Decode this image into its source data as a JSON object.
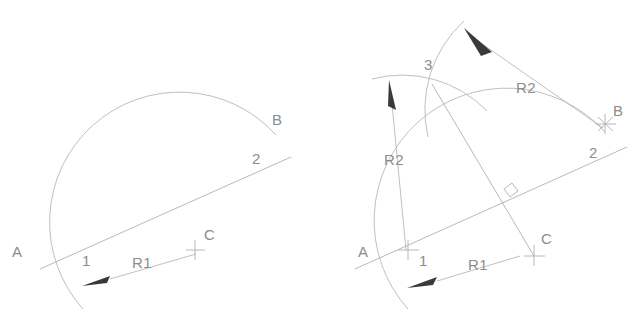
{
  "drawing": {
    "title": "Arc through three points construction",
    "background_color": "#ffffff",
    "line_color": "#b0b0b0",
    "arc_color": "#b8b8b8",
    "text_color": "#8c8c8c",
    "arrow_color": "#3a3a3a",
    "panels": [
      {
        "name": "step-1",
        "labels": [
          {
            "key": "point_a",
            "text": "A"
          },
          {
            "key": "point_b",
            "text": "B"
          },
          {
            "key": "point_c",
            "text": "C"
          },
          {
            "key": "point_1",
            "text": "1"
          },
          {
            "key": "point_2",
            "text": "2"
          },
          {
            "key": "radius_1",
            "text": "R1"
          }
        ]
      },
      {
        "name": "step-2",
        "labels": [
          {
            "key": "point_a",
            "text": "A"
          },
          {
            "key": "point_b",
            "text": "B"
          },
          {
            "key": "point_c",
            "text": "C"
          },
          {
            "key": "point_1",
            "text": "1"
          },
          {
            "key": "point_2",
            "text": "2"
          },
          {
            "key": "point_3",
            "text": "3"
          },
          {
            "key": "radius_1",
            "text": "R1"
          },
          {
            "key": "radius_2_left",
            "text": "R2"
          },
          {
            "key": "radius_2_right",
            "text": "R2"
          }
        ]
      }
    ]
  },
  "left": {
    "label_a": "A",
    "label_b": "B",
    "label_c": "C",
    "label_1": "1",
    "label_2": "2",
    "label_r1": "R1"
  },
  "right": {
    "label_a": "A",
    "label_b": "B",
    "label_c": "C",
    "label_1": "1",
    "label_2": "2",
    "label_3": "3",
    "label_r1": "R1",
    "label_r2_left": "R2",
    "label_r2_right": "R2"
  },
  "colors": {
    "line": "#b0b0b0",
    "arc": "#b8b8b8",
    "text": "#8c8c8c",
    "arrow": "#3a3a3a",
    "background": "#ffffff"
  }
}
